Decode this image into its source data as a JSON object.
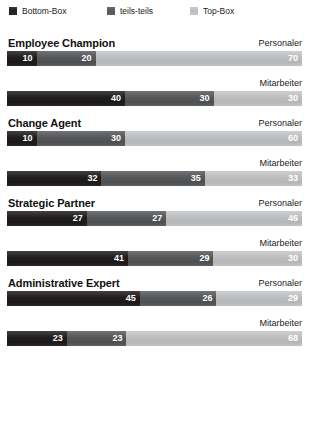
{
  "legend": {
    "items": [
      {
        "label": "Bottom-Box",
        "swatch": "bottom-box-swatch",
        "color": "#231f20"
      },
      {
        "label": "teils-teils",
        "swatch": "teils-teils-swatch",
        "color": "#58595b"
      },
      {
        "label": "Top-Box",
        "swatch": "top-box-swatch",
        "color": "#bcbec0"
      }
    ]
  },
  "chart_data": {
    "type": "bar",
    "title": "",
    "xlabel": "",
    "ylabel": "",
    "xlim": [
      0,
      100
    ],
    "grid": false,
    "orientation": "horizontal",
    "stacked": true,
    "stack_total": 100,
    "legend_position": "top-left",
    "series": [
      {
        "name": "Bottom-Box",
        "color": "#231f20"
      },
      {
        "name": "teils-teils",
        "color": "#58595b"
      },
      {
        "name": "Top-Box",
        "color": "#bcbec0"
      }
    ],
    "groups": [
      {
        "category": "Employee Champion",
        "rows": [
          {
            "label": "Personaler",
            "values": [
              10,
              20,
              70
            ]
          },
          {
            "label": "Mitarbeiter",
            "values": [
              40,
              30,
              30
            ]
          }
        ]
      },
      {
        "category": "Change Agent",
        "rows": [
          {
            "label": "Personaler",
            "values": [
              10,
              30,
              60
            ]
          },
          {
            "label": "Mitarbeiter",
            "values": [
              32,
              35,
              33
            ]
          }
        ]
      },
      {
        "category": "Strategic Partner",
        "rows": [
          {
            "label": "Personaler",
            "values": [
              27,
              27,
              46
            ]
          },
          {
            "label": "Mitarbeiter",
            "values": [
              41,
              29,
              30
            ]
          }
        ]
      },
      {
        "category": "Administrative Expert",
        "rows": [
          {
            "label": "Personaler",
            "values": [
              45,
              26,
              29
            ]
          },
          {
            "label": "Mitarbeiter",
            "values": [
              23,
              23,
              68
            ]
          }
        ]
      }
    ]
  }
}
